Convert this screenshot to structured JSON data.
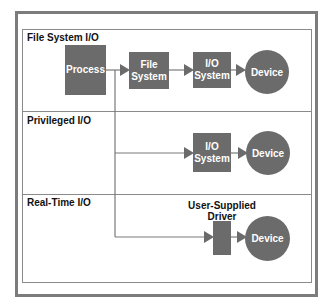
{
  "sections": [
    {
      "label": "File System I/O",
      "nodes": {
        "process": "Process",
        "file_system": [
          "File",
          "System"
        ],
        "io_system": [
          "I/O",
          "System"
        ],
        "device": "Device"
      }
    },
    {
      "label": "Privileged I/O",
      "nodes": {
        "io_system": [
          "I/O",
          "System"
        ],
        "device": "Device"
      }
    },
    {
      "label": "Real-Time I/O",
      "nodes": {
        "driver_label": [
          "User-Supplied",
          "Driver"
        ],
        "device": "Device"
      }
    }
  ],
  "colors": {
    "node_fill": "#6b6b6b",
    "node_text": "#ffffff",
    "line": "#7a7a7a",
    "frame": "#7c7c7c"
  }
}
